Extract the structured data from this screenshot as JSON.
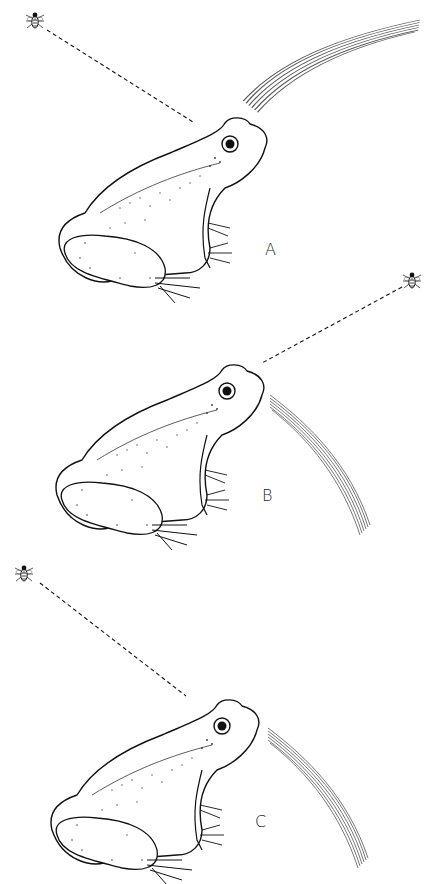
{
  "figure": {
    "colors": {
      "ink": "#1a1a1a",
      "background": "#ffffff"
    },
    "panels": [
      {
        "label": "A",
        "fly_position": "upper-left",
        "sight_line": "dashed"
      },
      {
        "label": "B",
        "fly_position": "upper-right",
        "sight_line": "dashed"
      },
      {
        "label": "C",
        "fly_position": "upper-left",
        "sight_line": "dashed"
      }
    ]
  }
}
